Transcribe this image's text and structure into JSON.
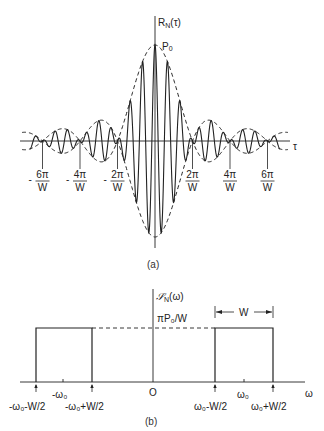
{
  "figure_a": {
    "caption": "(a)",
    "y_label_main": "R",
    "y_label_sub": "N",
    "y_label_arg": "(τ)",
    "peak_label_main": "P",
    "peak_label_sub": "0",
    "x_label": "τ",
    "ticks": [
      {
        "sign": "-",
        "num": "6π",
        "den": "W",
        "value_over_pi_W": -6
      },
      {
        "sign": "-",
        "num": "4π",
        "den": "W",
        "value_over_pi_W": -4
      },
      {
        "sign": "-",
        "num": "2π",
        "den": "W",
        "value_over_pi_W": -2
      },
      {
        "sign": "",
        "num": "2π",
        "den": "W",
        "value_over_pi_W": 2
      },
      {
        "sign": "",
        "num": "4π",
        "den": "W",
        "value_over_pi_W": 4
      },
      {
        "sign": "",
        "num": "6π",
        "den": "W",
        "value_over_pi_W": 6
      }
    ],
    "waveform": {
      "description": "R_N(τ) = P0 · [sin(Wτ/2)/(Wτ/2)] · cos(ω0 τ), shown with dashed envelope ±P0·sinc",
      "envelope_zero_spacing": "2π/W",
      "carrier_cycles_per_lobe": 3
    }
  },
  "figure_b": {
    "caption": "(b)",
    "y_label_main": "𝒮",
    "y_label_sub": "N",
    "y_label_arg": "(ω)",
    "level_label": "πP₀/W",
    "width_label": "W",
    "x_label": "ω",
    "origin_label": "O",
    "center_labels": {
      "neg": "-ω₀",
      "pos": "ω₀"
    },
    "edge_labels": [
      "-ω₀-W/2",
      "-ω₀+W/2",
      "ω₀-W/2",
      "ω₀+W/2"
    ],
    "bands": [
      {
        "center": "-ω₀",
        "lower": "-ω₀-W/2",
        "upper": "-ω₀+W/2",
        "height": "πP₀/W"
      },
      {
        "center": "ω₀",
        "lower": "ω₀-W/2",
        "upper": "ω₀+W/2",
        "height": "πP₀/W"
      }
    ]
  },
  "colors": {
    "ink": "#222222",
    "background": "#ffffff"
  }
}
